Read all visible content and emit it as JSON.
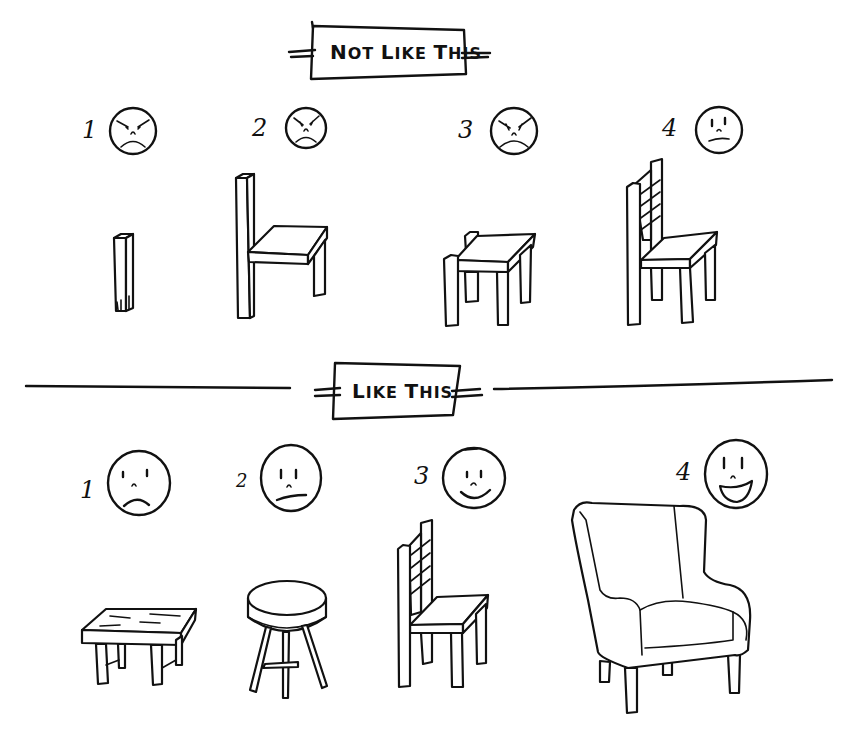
{
  "sections": {
    "bad": {
      "title_first": "N",
      "title_rest_1": "OT ",
      "title_l": "L",
      "title_rest_2": "IKE ",
      "title_t": "T",
      "title_rest_3": "HIS",
      "title": "Not Like This",
      "items": [
        {
          "number": "1",
          "mood": "angry",
          "object": "single wooden leg"
        },
        {
          "number": "2",
          "mood": "angry",
          "object": "chair with one back post and two legs"
        },
        {
          "number": "3",
          "mood": "angry",
          "object": "chair with no backrest"
        },
        {
          "number": "4",
          "mood": "displeased",
          "object": "wooden ladder-back chair"
        }
      ]
    },
    "good": {
      "title_l": "L",
      "title_rest_1": "IKE ",
      "title_t": "T",
      "title_rest_2": "HIS",
      "title": "Like This",
      "items": [
        {
          "number": "1",
          "mood": "sad",
          "object": "rough wooden bench"
        },
        {
          "number": "2",
          "mood": "unsure",
          "object": "round stool"
        },
        {
          "number": "3",
          "mood": "smiling",
          "object": "wooden ladder-back chair"
        },
        {
          "number": "4",
          "mood": "very happy",
          "object": "upholstered wingback armchair"
        }
      ]
    }
  },
  "colors": {
    "ink": "#111111",
    "paper": "#ffffff"
  }
}
